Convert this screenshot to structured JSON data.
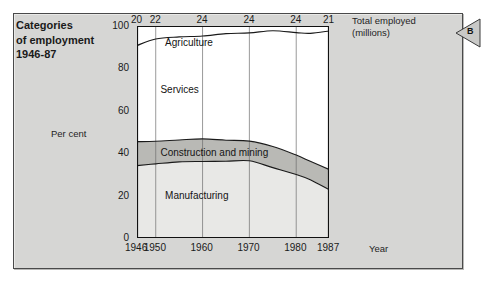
{
  "figure": {
    "title_lines": [
      "Categories",
      "of employment",
      "1946-87"
    ],
    "marker_letter": "B",
    "panel_color": "#d6d6d4"
  },
  "chart_data": {
    "type": "area",
    "stacked": true,
    "title": "Categories of employment 1946-87",
    "xlabel": "Year",
    "ylabel": "Per cent",
    "ylim": [
      0,
      100
    ],
    "xlim": [
      1946,
      1987
    ],
    "grid": true,
    "legend_position": "inline-band-labels",
    "yticks": [
      "0",
      "20",
      "40",
      "60",
      "80",
      "100"
    ],
    "ytick_values": [
      0,
      20,
      40,
      60,
      80,
      100
    ],
    "xticks": [
      "1946",
      "1950",
      "1960",
      "1970",
      "1980",
      "1987"
    ],
    "xtick_values": [
      1946,
      1950,
      1960,
      1970,
      1980,
      1987
    ],
    "secondary_axis": {
      "label_lines": [
        "Total employed",
        "(millions)"
      ],
      "position": "top",
      "ticks": [
        {
          "year": 1946,
          "value": "20"
        },
        {
          "year": 1950,
          "value": "22"
        },
        {
          "year": 1960,
          "value": "24"
        },
        {
          "year": 1970,
          "value": "24"
        },
        {
          "year": 1980,
          "value": "24"
        },
        {
          "year": 1987,
          "value": "21"
        }
      ]
    },
    "gridline_years": [
      1950,
      1960,
      1970,
      1980
    ],
    "x": [
      1946,
      1950,
      1955,
      1960,
      1965,
      1970,
      1975,
      1980,
      1983,
      1987
    ],
    "series": [
      {
        "name": "Manufacturing",
        "fill": "#e8e8e6",
        "label_x": 1952,
        "label_y": 20,
        "values": [
          34,
          35.5,
          36,
          36,
          36.5,
          36,
          33,
          30,
          27,
          23
        ]
      },
      {
        "name": "Construction and mining",
        "fill": "#b9b9b5",
        "label_x": 1951,
        "label_y": 40,
        "values": [
          11,
          10,
          10.5,
          10.5,
          10,
          10,
          10,
          9.5,
          9,
          9
        ]
      },
      {
        "name": "Services",
        "fill": "#ffffff",
        "label_x": 1951,
        "label_y": 70,
        "values": [
          46,
          48,
          48.5,
          48.5,
          49.5,
          51,
          54.5,
          57.5,
          61,
          65.5
        ]
      },
      {
        "name": "Agriculture",
        "fill": "#ffffff",
        "label_x": 1952,
        "label_y": 92,
        "values": [
          9,
          6.5,
          5,
          5,
          4,
          3,
          2.5,
          3,
          3,
          2.5
        ]
      }
    ]
  }
}
